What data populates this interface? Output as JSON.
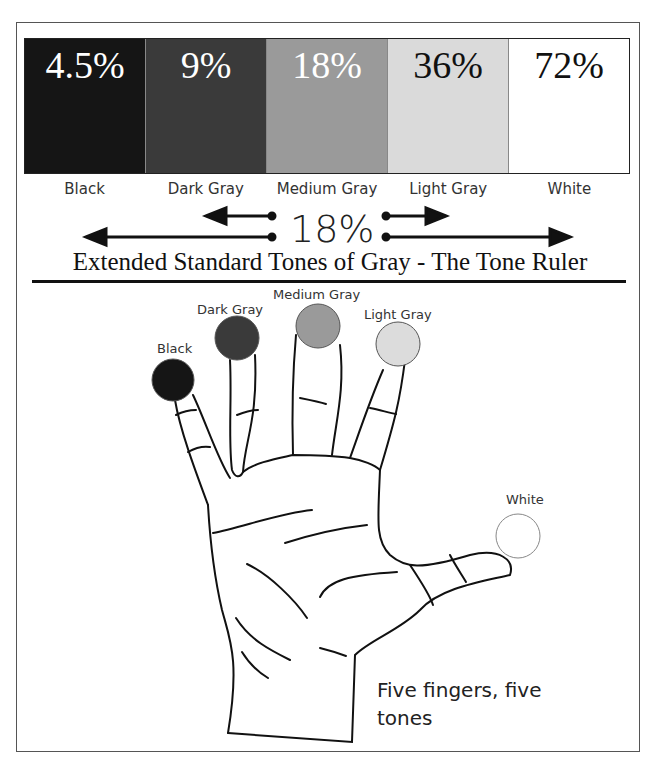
{
  "swatches": [
    {
      "pct": "4.5%",
      "label": "Black",
      "color": "#151515",
      "text_color": "#ffffff"
    },
    {
      "pct": "9%",
      "label": "Dark Gray",
      "color": "#3a3a3a",
      "text_color": "#ffffff"
    },
    {
      "pct": "18%",
      "label": "Medium Gray",
      "color": "#9a9a9a",
      "text_color": "#ffffff"
    },
    {
      "pct": "36%",
      "label": "Light Gray",
      "color": "#dadada",
      "text_color": "#111111"
    },
    {
      "pct": "72%",
      "label": "White",
      "color": "#ffffff",
      "text_color": "#111111"
    }
  ],
  "center_value": "18%",
  "title": "Extended Standard Tones of Gray - The Tone Ruler",
  "hand": {
    "fingers": [
      {
        "label": "Black",
        "color": "#151515"
      },
      {
        "label": "Dark Gray",
        "color": "#3a3a3a"
      },
      {
        "label": "Medium Gray",
        "color": "#9a9a9a"
      },
      {
        "label": "Light Gray",
        "color": "#dcdcdc"
      },
      {
        "label": "White",
        "color": "#ffffff"
      }
    ],
    "caption_line1": "Five fingers, five",
    "caption_line2": "tones"
  }
}
